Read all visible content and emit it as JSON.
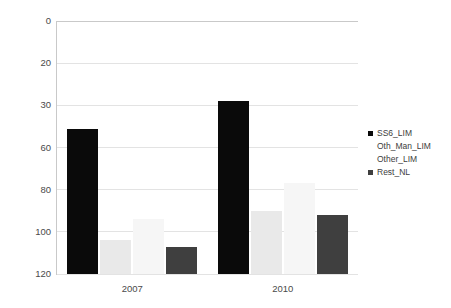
{
  "chart_data": {
    "type": "bar",
    "title": "",
    "subtitle": "",
    "xlabel": "",
    "ylabel": "",
    "categories": [
      "2007",
      "2010"
    ],
    "series": [
      {
        "name": "SS6_LIM",
        "values": [
          47,
          29
        ],
        "color": "#0a0a0a"
      },
      {
        "name": "Oth_Man_LIM",
        "values": [
          104,
          90
        ],
        "color": "#e9e9e9"
      },
      {
        "name": "Other_LIM",
        "values": [
          94,
          77
        ],
        "color": "#f6f6f6"
      },
      {
        "name": "Rest_NL",
        "values": [
          107,
          92
        ],
        "color": "#3f3f3f"
      }
    ],
    "ylim": [
      0,
      120
    ],
    "y_ticks": [
      0,
      20,
      30,
      60,
      80,
      100,
      120
    ],
    "y_tick_labels": [
      "0",
      "20",
      "30",
      "60",
      "80",
      "100",
      "120"
    ],
    "grid": true,
    "legend_position": "right",
    "annotations": []
  },
  "axes": {
    "grid_color": "#e3e3e3",
    "axis_color": "#c9c9c9",
    "tick_text_color": "#4a4a4a"
  },
  "legend": {
    "items": [
      {
        "label": "SS6_LIM",
        "swatch": "visible"
      },
      {
        "label": "Oth_Man_LIM",
        "swatch": "hidden"
      },
      {
        "label": "Other_LIM",
        "swatch": "hidden"
      },
      {
        "label": "Rest_NL",
        "swatch": "visible"
      }
    ]
  }
}
